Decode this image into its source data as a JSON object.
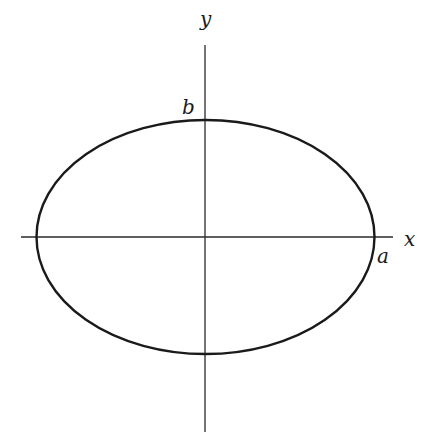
{
  "diagram": {
    "type": "ellipse-on-axes",
    "colors": {
      "stroke": "#1a1a1a",
      "axis": "#2a2a2a",
      "background": "#ffffff"
    },
    "axes": {
      "x": {
        "label": "x"
      },
      "y": {
        "label": "y"
      }
    },
    "ellipse": {
      "semi_major_label": "a",
      "semi_minor_label": "b"
    }
  }
}
